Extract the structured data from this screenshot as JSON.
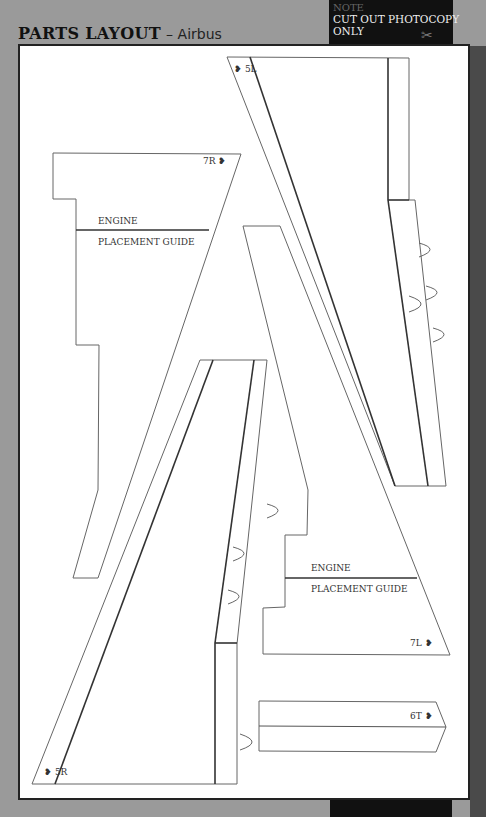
{
  "header": {
    "title": "PARTS LAYOUT",
    "subtitle": "– Airbus"
  },
  "note": {
    "heading": "NOTE",
    "line1": "CUT OUT PHOTOCOPY",
    "line2": "ONLY",
    "icon": "scissors-icon",
    "scissors_glyph": "✂"
  },
  "parts": {
    "p5L": {
      "label": "5L",
      "marker": "❥"
    },
    "p7R": {
      "label": "7R",
      "marker": "❥",
      "guide_top": "ENGINE",
      "guide_bottom": "PLACEMENT GUIDE"
    },
    "p5R": {
      "label": "5R",
      "marker": "❥"
    },
    "p7L": {
      "label": "7L",
      "marker": "❥",
      "guide_top": "ENGINE",
      "guide_bottom": "PLACEMENT GUIDE"
    },
    "p6T": {
      "label": "6T",
      "marker": "❥"
    }
  },
  "colors": {
    "background": "#9a9a9a",
    "page": "#ffffff",
    "note_box": "#111111",
    "outline": "#555555",
    "fold_line": "#333333"
  }
}
